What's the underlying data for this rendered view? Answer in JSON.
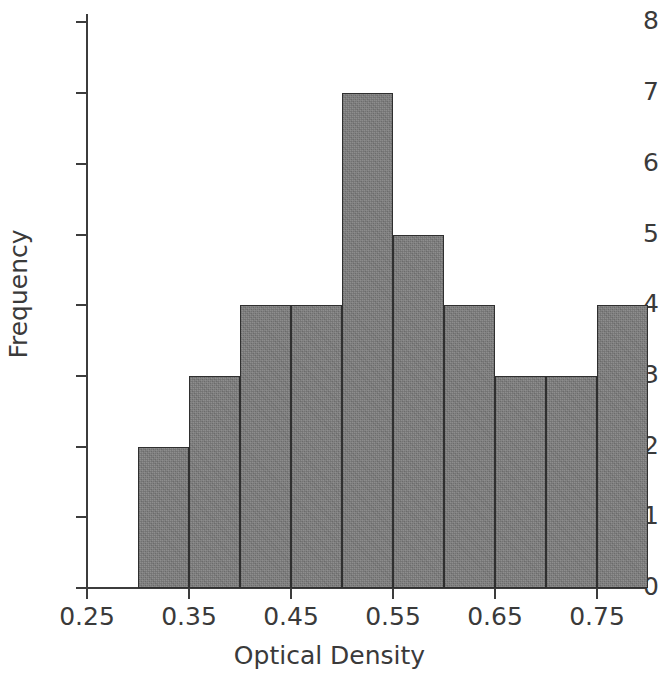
{
  "chart_data": {
    "type": "bar",
    "title": "",
    "subtitle": "",
    "xlabel": "Optical Density",
    "ylabel": "Frequency",
    "xlim": [
      0.25,
      0.8
    ],
    "ylim": [
      0,
      8
    ],
    "grid": false,
    "legend": null,
    "bin_width": 0.05,
    "bin_edges": [
      0.3,
      0.35,
      0.4,
      0.45,
      0.5,
      0.55,
      0.6,
      0.65,
      0.7,
      0.75,
      0.8
    ],
    "categories": [
      "0.30-0.35",
      "0.35-0.40",
      "0.40-0.45",
      "0.45-0.50",
      "0.50-0.55",
      "0.55-0.60",
      "0.60-0.65",
      "0.65-0.70",
      "0.70-0.75",
      "0.75-0.80"
    ],
    "values": [
      2,
      3,
      4,
      4,
      7,
      5,
      4,
      3,
      3,
      4
    ],
    "total_count": 39,
    "x_tick_labels": [
      "0.25",
      "0.35",
      "0.45",
      "0.55",
      "0.65",
      "0.75"
    ],
    "x_tick_values": [
      0.25,
      0.35,
      0.45,
      0.55,
      0.65,
      0.75
    ],
    "y_tick_labels": [
      "0",
      "1",
      "2",
      "3",
      "4",
      "5",
      "6",
      "7",
      "8"
    ],
    "y_tick_values": [
      0,
      1,
      2,
      3,
      4,
      5,
      6,
      7,
      8
    ],
    "colors": {
      "bar_fill": "#7c7c7c",
      "bar_edge": "#2f2f2f",
      "axis": "#3c3c3c",
      "text": "#3a3a3a",
      "background": "#ffffff"
    }
  }
}
